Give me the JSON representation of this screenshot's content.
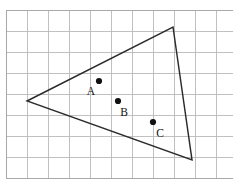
{
  "figure": {
    "kind": "geometry-diagram",
    "canvas": {
      "width": 233,
      "height": 185
    },
    "background_color": "#ffffff"
  },
  "grid": {
    "origin_x": 6,
    "origin_y": 10,
    "cell_size": 21,
    "columns": 11,
    "rows": 8,
    "line_color": "#b9b9b9",
    "border_color": "#a8a8a8",
    "show_grid": true
  },
  "triangle": {
    "name": "triangle",
    "stroke_color": "#2b2b2b",
    "stroke_width": 1.45,
    "fill": "none",
    "vertices": [
      {
        "id": "left-vertex",
        "x": 27,
        "y": 101
      },
      {
        "id": "top-right-vertex",
        "x": 173,
        "y": 27
      },
      {
        "id": "bottom-right-vertex",
        "x": 192,
        "y": 160
      }
    ],
    "points_attr": "27,101 173,27 192,160"
  },
  "points": [
    {
      "label": "A",
      "dot_x": 99,
      "dot_y": 81,
      "dot_radius": 3.1,
      "label_x": 91,
      "label_y": 95,
      "dot_color": "#111111"
    },
    {
      "label": "B",
      "dot_x": 118,
      "dot_y": 101,
      "dot_radius": 3.1,
      "label_x": 124,
      "label_y": 116,
      "dot_color": "#111111"
    },
    {
      "label": "C",
      "dot_x": 153,
      "dot_y": 122,
      "dot_radius": 3.1,
      "label_x": 160,
      "label_y": 137,
      "dot_color": "#111111"
    }
  ]
}
